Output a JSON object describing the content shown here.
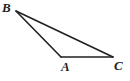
{
  "figure": {
    "kind": "geometry-diagram",
    "background_color": "#ffffff",
    "stroke_color": "#231f20",
    "stroke_width": 1.6,
    "width": 130,
    "height": 81
  },
  "vertices": {
    "B": {
      "label": "B",
      "x": 16,
      "y": 11,
      "label_x": 2,
      "label_y": 1
    },
    "A": {
      "label": "A",
      "x": 61,
      "y": 57,
      "label_x": 61,
      "label_y": 60
    },
    "C": {
      "label": "C",
      "x": 113,
      "y": 57,
      "label_x": 114,
      "label_y": 59
    }
  },
  "segments": [
    {
      "name": "segment-BA",
      "from": "B",
      "to": "A",
      "points": "16,11 61,57"
    },
    {
      "name": "segment-BC",
      "from": "B",
      "to": "C",
      "points": "16,11 113,57"
    },
    {
      "name": "segment-AC",
      "from": "A",
      "to": "C",
      "points": "61,57 113,57"
    }
  ],
  "chart_data": {
    "type": "scatter",
    "title": "",
    "xlabel": "",
    "ylabel": "",
    "x": [
      16,
      61,
      113
    ],
    "y": [
      11,
      57,
      57
    ],
    "point_labels": [
      "B",
      "A",
      "C"
    ],
    "grid": false
  }
}
